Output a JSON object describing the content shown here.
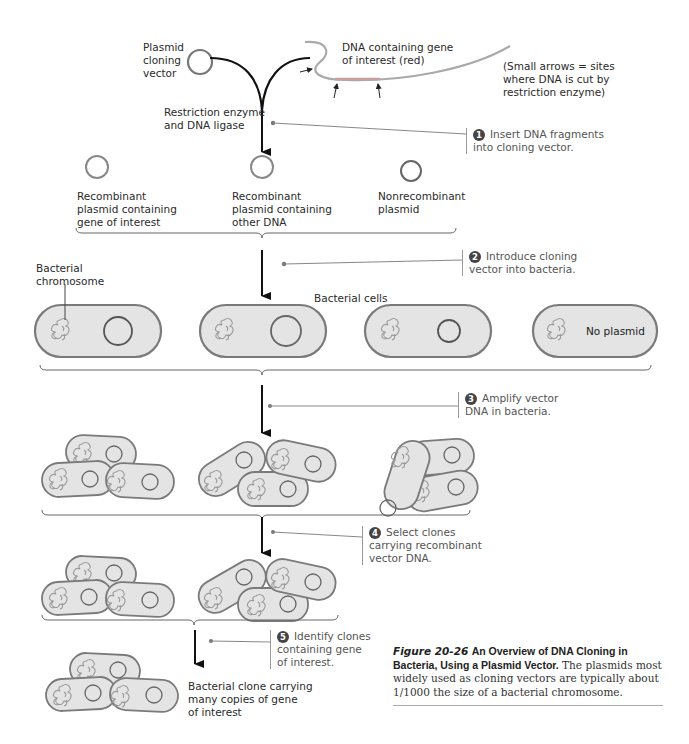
{
  "top": {
    "vector_label": "Plasmid\ncloning\nvector",
    "dna_label": "DNA containing gene\nof interest (red)",
    "arrows_note": "(Small arrows = sites\nwhere DNA is cut by\nrestriction enzyme)",
    "enzyme_label": "Restriction enzyme\nand DNA ligase"
  },
  "plasmids": [
    {
      "label": "Recombinant\nplasmid containing\ngene of interest"
    },
    {
      "label": "Recombinant\nplasmid containing\nother DNA"
    },
    {
      "label": "Nonrecombinant\nplasmid"
    }
  ],
  "steps": [
    {
      "num": "1",
      "text": "Insert DNA fragments\ninto cloning vector."
    },
    {
      "num": "2",
      "text": "Introduce cloning\nvector into bacteria."
    },
    {
      "num": "3",
      "text": "Amplify vector\nDNA in bacteria."
    },
    {
      "num": "4",
      "text": "Select clones\ncarrying recombinant\nvector DNA."
    },
    {
      "num": "5",
      "text": "Identify clones\ncontaining gene\nof interest."
    }
  ],
  "cells": {
    "chromosome_label": "Bacterial\nchromosome",
    "cells_label": "Bacterial cells",
    "no_plasmid_label": "No plasmid",
    "final_label": "Bacterial clone carrying\nmany copies of gene\nof interest"
  },
  "caption": {
    "figure": "Figure 20-26",
    "title": "An Overview of DNA Cloning in Bacteria, Using a Plasmid Vector.",
    "body": "The plasmids most widely used as cloning vectors are typically about 1/1000 the size of a bacterial chromosome."
  },
  "colors": {
    "cell_fill": "#e4e4e4",
    "cell_stroke": "#7a7a7a",
    "dna_gray": "#a8a8a8",
    "arrow": "#111111",
    "step_badge": "#444444"
  }
}
